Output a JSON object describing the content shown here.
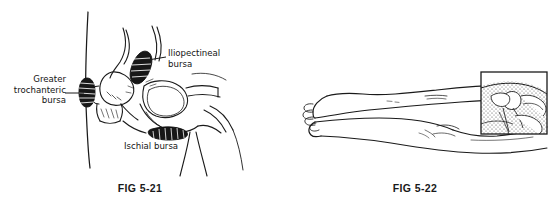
{
  "plate": {
    "background_color": "#ffffff",
    "ink_color": "#1a1a1a"
  },
  "figures": [
    {
      "id": "fig-5-21",
      "caption": "FIG 5-21",
      "subject": "Bursae of the hip and pelvis (lateral/oblique view)",
      "labels": [
        {
          "name": "greater-trochanteric-bursa",
          "lines": [
            "Greater",
            "trochanteric",
            "bursa"
          ],
          "align": "right",
          "leader": true
        },
        {
          "name": "iliopectineal-bursa",
          "lines": [
            "Iliopectineal",
            "bursa"
          ],
          "align": "left",
          "leader": true
        },
        {
          "name": "ischial-bursa",
          "lines": [
            "Ischial bursa"
          ],
          "align": "left",
          "leader": false
        }
      ]
    },
    {
      "id": "fig-5-22",
      "caption": "FIG 5-22",
      "subject": "Patient lying prone with legs extended; inset detail of hip joint",
      "labels": [],
      "inset": {
        "name": "hip-detail-inset",
        "border_color": "#1a1a1a",
        "fill": "stippled"
      }
    }
  ]
}
